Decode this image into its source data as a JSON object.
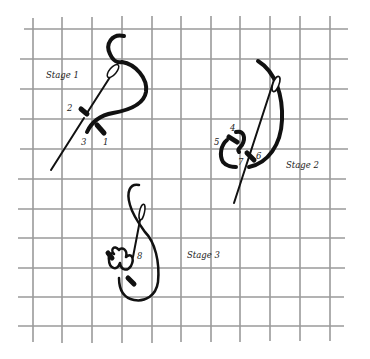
{
  "figure": {
    "type": "embroidery-stitch-diagram",
    "colors": {
      "grid": "#9a9a9a",
      "thread": "#111111",
      "text": "#222222",
      "background": "#ffffff"
    },
    "grid": {
      "columns": 11,
      "rows": 11,
      "spacing_px": 30
    },
    "stages": [
      {
        "label": "Stage 1",
        "points": [
          {
            "label": "1"
          },
          {
            "label": "2"
          },
          {
            "label": "3"
          }
        ]
      },
      {
        "label": "Stage 2",
        "points": [
          {
            "label": "4"
          },
          {
            "label": "5"
          },
          {
            "label": "6"
          },
          {
            "label": "7"
          }
        ]
      },
      {
        "label": "Stage 3",
        "points": [
          {
            "label": "8"
          }
        ]
      }
    ]
  }
}
